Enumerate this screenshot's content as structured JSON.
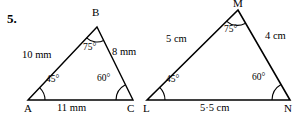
{
  "page": {
    "question_number": "5.",
    "background_color": "#ffffff",
    "ink_color": "#000000"
  },
  "figures": [
    {
      "id": "triangle-abc",
      "name": "triangle-ABC",
      "unit": "mm",
      "vertices": [
        {
          "label": "A",
          "x": 28,
          "y": 100,
          "label_x": 24,
          "label_y": 103
        },
        {
          "label": "B",
          "x": 97,
          "y": 27,
          "label_x": 93,
          "label_y": 8
        },
        {
          "label": "C",
          "x": 133,
          "y": 100,
          "label_x": 128,
          "label_y": 103
        }
      ],
      "sides": [
        {
          "name": "side-AB",
          "label": "10 mm",
          "label_x": 24,
          "label_y": 55
        },
        {
          "name": "side-BC",
          "label": "8 mm",
          "label_x": 113,
          "label_y": 52
        },
        {
          "name": "side-AC",
          "label": "11 mm",
          "label_x": 58,
          "label_y": 103
        }
      ],
      "angles": [
        {
          "name": "angle-A",
          "label": "45°",
          "label_x": 48,
          "label_y": 80,
          "vertex_x": 28,
          "vertex_y": 100,
          "radius": 17,
          "start_deg": 0,
          "end_deg": 46
        },
        {
          "name": "angle-B",
          "label": "75°",
          "label_x": 86,
          "label_y": 46,
          "vertex_x": 97,
          "vertex_y": 27,
          "radius": 15,
          "start_deg": 226,
          "end_deg": 296
        },
        {
          "name": "angle-C",
          "label": "60°",
          "label_x": 100,
          "label_y": 80,
          "vertex_x": 133,
          "vertex_y": 100,
          "radius": 17,
          "start_deg": 118,
          "end_deg": 180
        }
      ]
    },
    {
      "id": "triangle-lmn",
      "name": "triangle-LMN",
      "unit": "cm",
      "vertices": [
        {
          "label": "L",
          "x": 147,
          "y": 100,
          "label_x": 144,
          "label_y": 103
        },
        {
          "label": "M",
          "x": 238,
          "y": 10,
          "label_x": 234,
          "label_y": -2
        },
        {
          "label": "N",
          "x": 290,
          "y": 100,
          "label_x": 286,
          "label_y": 103
        }
      ],
      "sides": [
        {
          "name": "side-LM",
          "label": "5 cm",
          "label_x": 168,
          "label_y": 38
        },
        {
          "name": "side-MN",
          "label": "4 cm",
          "label_x": 266,
          "label_y": 35
        },
        {
          "name": "side-LN",
          "label": "5·5 cm",
          "label_x": 202,
          "label_y": 103
        }
      ],
      "angles": [
        {
          "name": "angle-L",
          "label": "45°",
          "label_x": 168,
          "label_y": 80,
          "vertex_x": 147,
          "vertex_y": 100,
          "radius": 18,
          "start_deg": 0,
          "end_deg": 45
        },
        {
          "name": "angle-M",
          "label": "75°",
          "label_x": 227,
          "label_y": 28,
          "vertex_x": 238,
          "vertex_y": 10,
          "radius": 16,
          "start_deg": 225,
          "end_deg": 296
        },
        {
          "name": "angle-N",
          "label": "60°",
          "label_x": 255,
          "label_y": 79,
          "vertex_x": 290,
          "vertex_y": 100,
          "radius": 18,
          "start_deg": 120,
          "end_deg": 180
        }
      ]
    }
  ]
}
